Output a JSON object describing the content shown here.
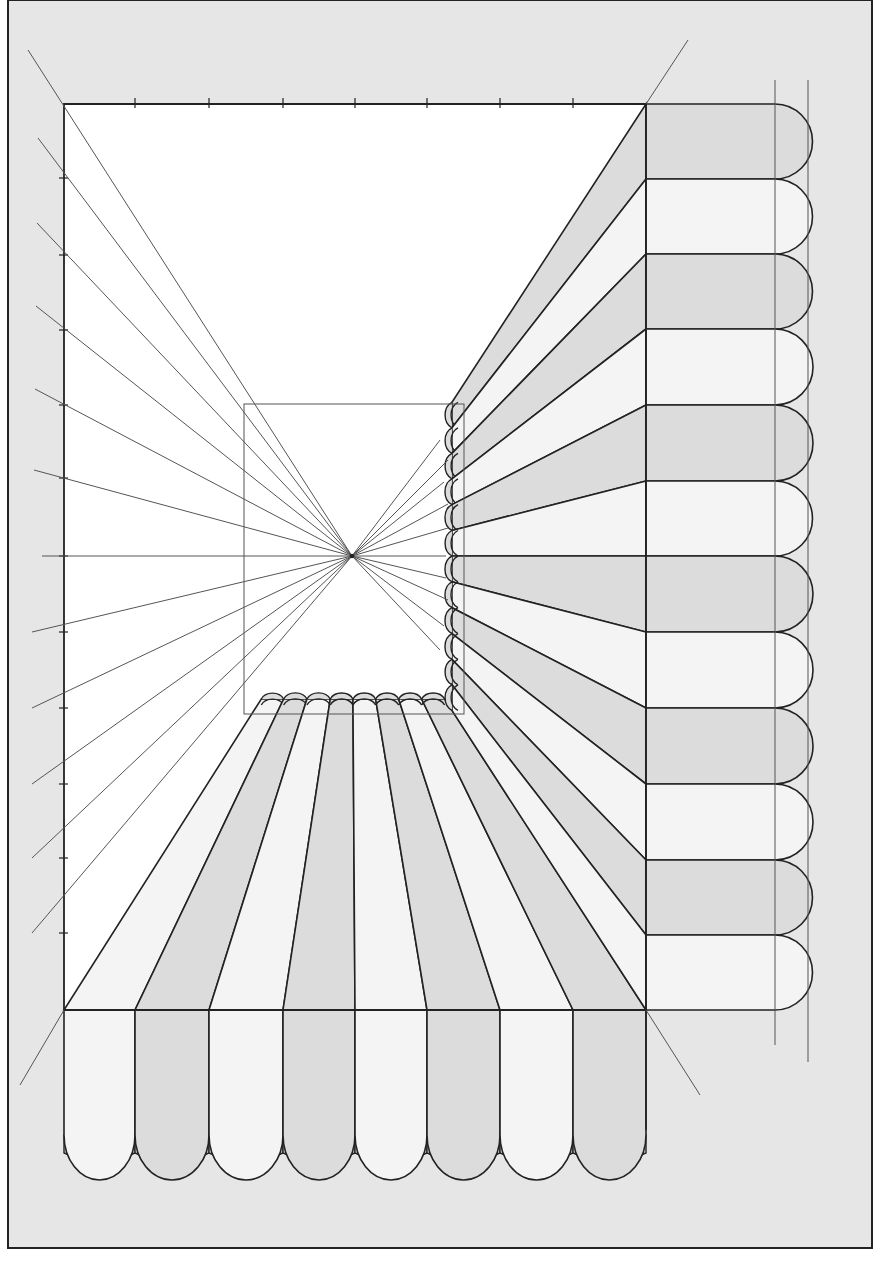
{
  "diagram": {
    "type": "one-point-perspective-awning",
    "colors": {
      "page_background": "#ffffff",
      "sheet_background": "#e6e6e6",
      "picture_plane": "#ffffff",
      "stripe_dark": "#dcdcdc",
      "stripe_light": "#f4f4f4",
      "line": "#222222",
      "construction_line": "#555555"
    },
    "sheet": {
      "x": 8,
      "y": 0,
      "w": 864,
      "h": 1248
    },
    "picture_plane": {
      "x": 64,
      "y": 104,
      "w": 582,
      "h": 906
    },
    "inner_rect": {
      "x": 244,
      "y": 404,
      "w": 220,
      "h": 310
    },
    "vanishing_point": {
      "x": 352,
      "y": 556
    },
    "top_ticks_x": [
      135,
      209,
      283,
      355,
      427,
      500,
      573
    ],
    "left_ticks_y": [
      178,
      255,
      330,
      405,
      478,
      556,
      632,
      708,
      784,
      858,
      933
    ],
    "right_awning": {
      "front_x": 646,
      "scallop_start_x": 775,
      "stripe_edges_y": [
        104,
        179,
        254,
        329,
        405,
        481,
        556,
        632,
        708,
        784,
        860,
        935,
        1010
      ],
      "guide_lines_x": [
        775,
        808
      ],
      "guide_top_y": 80,
      "guide_bottom_y": [
        1045,
        1062
      ]
    },
    "bottom_awning": {
      "front_y": 1010,
      "stripe_edges_x": [
        64,
        135,
        209,
        283,
        355,
        427,
        500,
        573,
        646
      ],
      "side_bottom_y": 1135,
      "scallop_depth": 45,
      "fringe_y": 1165
    },
    "labels": {
      "vanishing_point": "VP",
      "title": ""
    }
  }
}
